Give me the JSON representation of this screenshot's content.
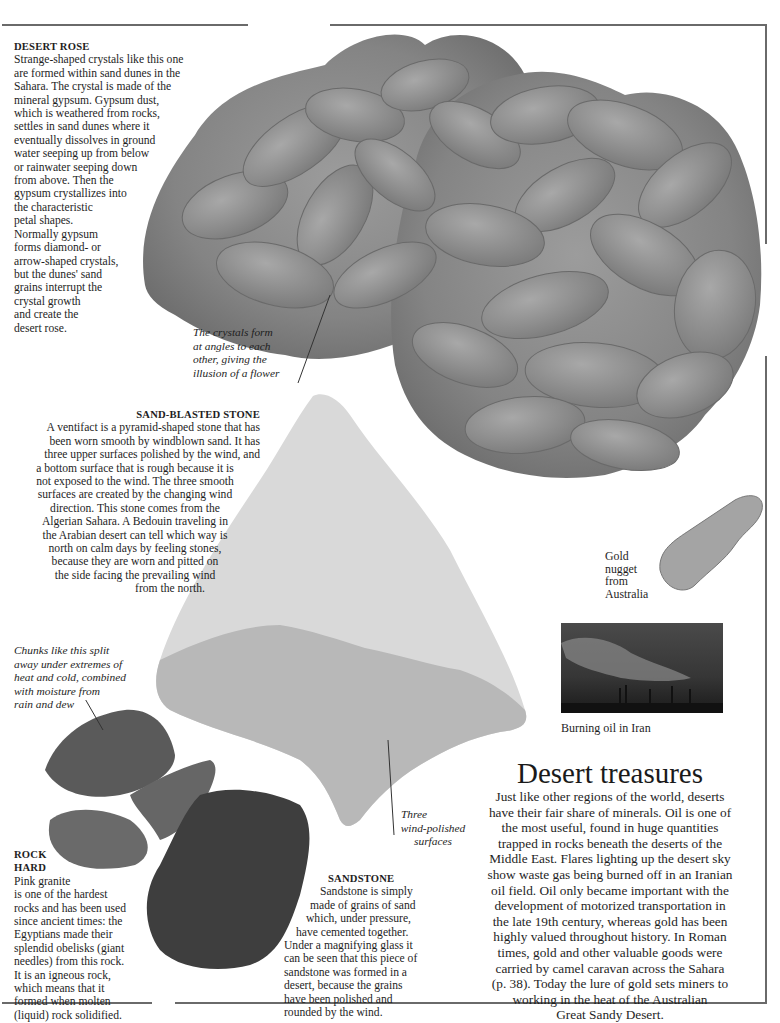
{
  "page": {
    "title": "Desert treasures",
    "intro_paragraph": [
      "Just like other regions of the world, deserts",
      "have their fair share of minerals. Oil is one of",
      "the most useful, found in huge quantities",
      "trapped in rocks beneath the deserts of the",
      "Middle East. Flares lighting up the desert sky",
      "show waste gas being burned off in an Iranian",
      "oil field. Oil only became important with the",
      "development of motorized transportation in",
      "the late 19th century, whereas gold has been",
      "highly valued throughout history. In Roman",
      "times, gold and other valuable goods were",
      "carried by camel caravan across the Sahara",
      "(p. 38). Today the lure of gold sets miners to",
      "working in the heat of the Australian",
      "Great Sandy Desert."
    ]
  },
  "desert_rose": {
    "heading": "DESERT ROSE",
    "lines": [
      "Strange-shaped crystals like this one",
      "are formed within sand dunes in the",
      "Sahara. The crystal is made of the",
      "mineral gypsum. Gypsum dust,",
      "which is weathered from rocks,",
      "settles in sand dunes where it",
      "eventually dissolves in ground",
      "water seeping up from below",
      "or rainwater seeping down",
      "from above. Then the",
      "gypsum crystallizes into",
      "the characteristic",
      "petal shapes.",
      "Normally gypsum",
      "forms diamond- or",
      "arrow-shaped crystals,",
      "but the dunes' sand",
      "grains interrupt the",
      "crystal growth",
      "and create the",
      "desert rose."
    ],
    "annotation": [
      "The crystals form",
      "at angles to each",
      "other, giving the",
      "illusion of a flower"
    ]
  },
  "sand_blasted_stone": {
    "heading": "SAND-BLASTED STONE",
    "lines": [
      "A ventifact is a pyramid-shaped stone that has",
      "been worn smooth by windblown sand. It has",
      "three upper surfaces polished by the wind, and",
      "a bottom surface that is rough because it is",
      "not exposed to the wind. The three smooth",
      "surfaces are created by the changing wind",
      "direction. This stone comes from the",
      "Algerian Sahara. A Bedouin traveling in",
      "the Arabian desert can tell which way is",
      "north on calm days by feeling stones,",
      "because they are worn and pitted on",
      "the side facing the prevailing wind",
      "from the north."
    ],
    "annotation": [
      "Three",
      "wind-polished",
      "surfaces"
    ]
  },
  "granite_chunks": {
    "annotation": [
      "Chunks like this split",
      "away under extremes of",
      "heat and cold, combined",
      "with moisture from",
      "rain and dew"
    ]
  },
  "rock_hard": {
    "heading_line1": "ROCK",
    "heading_line2": "HARD",
    "lines": [
      "Pink granite",
      "is one of the hardest",
      "rocks and has been used",
      "since ancient times: the",
      "Egyptians made their",
      "splendid obelisks (giant",
      "needles) from this rock.",
      "It is an igneous rock,",
      "which means that it",
      "formed when molten",
      "(liquid) rock solidified."
    ]
  },
  "sandstone": {
    "heading": "SANDSTONE",
    "lines": [
      "Sandstone is simply",
      "made of grains of sand",
      "which, under pressure,",
      "have cemented together.",
      "Under a magnifying glass it",
      "can be seen that this piece of",
      "sandstone was formed in a",
      "desert, because the grains",
      "have been polished and",
      "rounded by the wind."
    ]
  },
  "gold_nugget": {
    "caption": [
      "Gold",
      "nugget",
      "from",
      "Australia"
    ]
  },
  "burning_oil": {
    "caption": "Burning oil in Iran"
  },
  "colors": {
    "frame": "#6a6a6a",
    "text": "#1e1e1e",
    "rose_gray": "#8a8a8a",
    "ventifact_light": "#d8d8d8",
    "ventifact_dark": "#b4b4b4",
    "granite": "#555555",
    "sandstone": "#3c3c3c",
    "gold": "#a8a8a8",
    "oil_sky": "#3a3a3a"
  }
}
